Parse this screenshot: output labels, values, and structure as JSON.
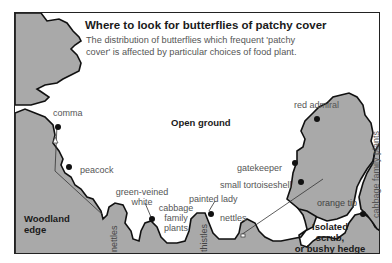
{
  "header": {
    "title": "Where to look for butterflies of patchy cover",
    "subtitle": "The distribution of butterflies which frequent 'patchy cover' is affected by particular choices of food plant."
  },
  "regions": {
    "open_ground": "Open ground",
    "woodland_edge_1": "Woodland",
    "woodland_edge_2": "edge",
    "scrub_1": "Isolated",
    "scrub_2": "scrub,",
    "scrub_3": "or bushy hedge"
  },
  "butterflies": {
    "comma": "comma",
    "peacock": "peacock",
    "green_veined_white_1": "green-veined",
    "green_veined_white_2": "white",
    "painted_lady": "painted lady",
    "red_admiral": "red admiral",
    "gatekeeper": "gatekeeper",
    "small_tortoiseshell": "small tortoiseshell",
    "orange_tip": "orange tip"
  },
  "food_plants": {
    "nettles_left": "nettles",
    "cabbage_1": "cabbage",
    "cabbage_2": "family",
    "cabbage_3": "plants",
    "thistles": "thistles",
    "nettles_right": "nettles",
    "cabbage_right": "cabbage family plants"
  },
  "colors": {
    "vegetation_fill": "#a9a9a9",
    "outline": "#111111",
    "frame": "#222222",
    "label_text": "#555555",
    "background": "#ffffff"
  }
}
